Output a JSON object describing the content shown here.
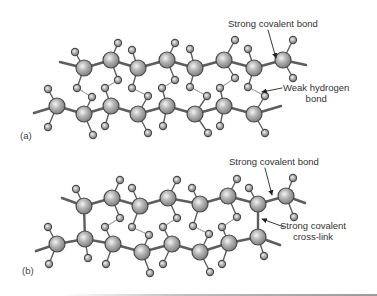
{
  "figure": {
    "panels": [
      {
        "id": "a",
        "label": "(a)",
        "label_pos": [
          20,
          130
        ],
        "annotations": [
          {
            "lines": [
              "Strong covalent bond"
            ],
            "pos": [
              228,
              18
            ],
            "align": "left",
            "arrow": {
              "from": [
                268,
                30
              ],
              "to": [
                276,
                58
              ]
            }
          },
          {
            "lines": [
              "Weak hydrogen",
              "bond"
            ],
            "pos": [
              283,
              82
            ],
            "align": "center",
            "arrow": {
              "from": [
                282,
                88
              ],
              "to": [
                262,
                92
              ]
            }
          }
        ],
        "chains": [
          {
            "line_start": [
              60,
              62
            ],
            "line_end": [
              306,
              65
            ],
            "atoms": [
              [
                84,
                68
              ],
              [
                111,
                60
              ],
              [
                138,
                68
              ],
              [
                167,
                60
              ],
              [
                195,
                68
              ],
              [
                224,
                60
              ],
              [
                254,
                68
              ],
              [
                283,
                60
              ]
            ]
          },
          {
            "line_start": [
              34,
              113
            ],
            "line_end": [
              281,
              106
            ],
            "atoms": [
              [
                57,
                106
              ],
              [
                84,
                114
              ],
              [
                111,
                106
              ],
              [
                138,
                114
              ],
              [
                167,
                106
              ],
              [
                195,
                114
              ],
              [
                224,
                106
              ],
              [
                254,
                114
              ]
            ]
          }
        ],
        "hydrogens": [
          {
            "at": [
              75,
              52
            ],
            "to": [
              84,
              68
            ]
          },
          {
            "at": [
              118,
              43
            ],
            "to": [
              111,
              60
            ]
          },
          {
            "at": [
              132,
              50
            ],
            "to": [
              138,
              68
            ]
          },
          {
            "at": [
              175,
              43
            ],
            "to": [
              167,
              60
            ]
          },
          {
            "at": [
              190,
              49
            ],
            "to": [
              195,
              68
            ]
          },
          {
            "at": [
              235,
              40
            ],
            "to": [
              224,
              60
            ]
          },
          {
            "at": [
              248,
              49
            ],
            "to": [
              254,
              68
            ]
          },
          {
            "at": [
              293,
              40
            ],
            "to": [
              283,
              60
            ]
          },
          {
            "at": [
              77,
              88
            ],
            "to": [
              84,
              68
            ]
          },
          {
            "at": [
              118,
              80
            ],
            "to": [
              111,
              60
            ]
          },
          {
            "at": [
              132,
              88
            ],
            "to": [
              138,
              68
            ]
          },
          {
            "at": [
              175,
              80
            ],
            "to": [
              167,
              60
            ]
          },
          {
            "at": [
              190,
              87
            ],
            "to": [
              195,
              68
            ]
          },
          {
            "at": [
              235,
              78
            ],
            "to": [
              224,
              60
            ]
          },
          {
            "at": [
              248,
              87
            ],
            "to": [
              254,
              68
            ]
          },
          {
            "at": [
              293,
              78
            ],
            "to": [
              283,
              60
            ]
          },
          {
            "at": [
              48,
              89
            ],
            "to": [
              57,
              106
            ]
          },
          {
            "at": [
              92,
              97
            ],
            "to": [
              84,
              114
            ]
          },
          {
            "at": [
              105,
              88
            ],
            "to": [
              111,
              106
            ]
          },
          {
            "at": [
              148,
              96
            ],
            "to": [
              138,
              114
            ]
          },
          {
            "at": [
              162,
              88
            ],
            "to": [
              167,
              106
            ]
          },
          {
            "at": [
              207,
              96
            ],
            "to": [
              195,
              114
            ]
          },
          {
            "at": [
              220,
              88
            ],
            "to": [
              224,
              106
            ]
          },
          {
            "at": [
              265,
              96
            ],
            "to": [
              254,
              114
            ]
          },
          {
            "at": [
              48,
              127
            ],
            "to": [
              57,
              106
            ]
          },
          {
            "at": [
              93,
              135
            ],
            "to": [
              84,
              114
            ]
          },
          {
            "at": [
              105,
              126
            ],
            "to": [
              111,
              106
            ]
          },
          {
            "at": [
              148,
              133
            ],
            "to": [
              138,
              114
            ]
          },
          {
            "at": [
              163,
              126
            ],
            "to": [
              167,
              106
            ]
          },
          {
            "at": [
              208,
              133
            ],
            "to": [
              195,
              114
            ]
          },
          {
            "at": [
              220,
              126
            ],
            "to": [
              224,
              106
            ]
          },
          {
            "at": [
              265,
              133
            ],
            "to": [
              254,
              114
            ]
          }
        ],
        "hydrogen_bonds": [
          [
            [
              77,
              88
            ],
            [
              92,
              97
            ]
          ],
          [
            [
              118,
              80
            ],
            [
              105,
              88
            ]
          ],
          [
            [
              132,
              88
            ],
            [
              148,
              96
            ]
          ],
          [
            [
              175,
              80
            ],
            [
              162,
              88
            ]
          ],
          [
            [
              190,
              87
            ],
            [
              207,
              96
            ]
          ],
          [
            [
              235,
              78
            ],
            [
              220,
              88
            ]
          ],
          [
            [
              248,
              87
            ],
            [
              265,
              96
            ]
          ]
        ],
        "cross_links": []
      },
      {
        "id": "b",
        "label": "(b)",
        "label_pos": [
          22,
          265
        ],
        "annotations": [
          {
            "lines": [
              "Strong covalent bond"
            ],
            "pos": [
              229,
              156
            ],
            "align": "left",
            "arrow": {
              "from": [
                265,
                168
              ],
              "to": [
                272,
                195
              ]
            }
          },
          {
            "lines": [
              "Strong covalent",
              "cross-link"
            ],
            "pos": [
              280,
              220
            ],
            "align": "center",
            "arrow": {
              "from": [
                284,
                227
              ],
              "to": [
                262,
                219
              ]
            }
          }
        ],
        "chains": [
          {
            "line_start": [
              62,
              198
            ],
            "line_end": [
              305,
              203
            ],
            "atoms": [
              [
                84,
                206
              ],
              [
                112,
                198
              ],
              [
                140,
                206
              ],
              [
                168,
                198
              ],
              [
                200,
                204
              ],
              [
                228,
                196
              ],
              [
                258,
                204
              ],
              [
                286,
                196
              ]
            ]
          },
          {
            "line_start": [
              36,
              251
            ],
            "line_end": [
              280,
              245
            ],
            "atoms": [
              [
                57,
                244
              ],
              [
                85,
                239
              ],
              [
                113,
                244
              ],
              [
                142,
                252
              ],
              [
                172,
                244
              ],
              [
                200,
                252
              ],
              [
                229,
                243
              ],
              [
                258,
                237
              ]
            ]
          }
        ],
        "hydrogens": [
          {
            "at": [
              76,
              189
            ],
            "to": [
              84,
              206
            ]
          },
          {
            "at": [
              120,
              180
            ],
            "to": [
              112,
              198
            ]
          },
          {
            "at": [
              132,
              188
            ],
            "to": [
              140,
              206
            ]
          },
          {
            "at": [
              177,
              180
            ],
            "to": [
              168,
              198
            ]
          },
          {
            "at": [
              192,
              188
            ],
            "to": [
              200,
              204
            ]
          },
          {
            "at": [
              237,
              179
            ],
            "to": [
              228,
              196
            ]
          },
          {
            "at": [
              249,
              188
            ],
            "to": [
              258,
              204
            ]
          },
          {
            "at": [
              293,
              178
            ],
            "to": [
              286,
              196
            ]
          },
          {
            "at": [
              120,
              218
            ],
            "to": [
              112,
              198
            ]
          },
          {
            "at": [
              132,
              227
            ],
            "to": [
              140,
              206
            ]
          },
          {
            "at": [
              177,
              218
            ],
            "to": [
              168,
              198
            ]
          },
          {
            "at": [
              193,
              226
            ],
            "to": [
              200,
              204
            ]
          },
          {
            "at": [
              237,
              217
            ],
            "to": [
              228,
              196
            ]
          },
          {
            "at": [
              294,
              217
            ],
            "to": [
              286,
              196
            ]
          },
          {
            "at": [
              48,
              227
            ],
            "to": [
              57,
              244
            ]
          },
          {
            "at": [
              105,
              227
            ],
            "to": [
              113,
              244
            ]
          },
          {
            "at": [
              149,
              235
            ],
            "to": [
              142,
              252
            ]
          },
          {
            "at": [
              163,
              227
            ],
            "to": [
              172,
              244
            ]
          },
          {
            "at": [
              209,
              234
            ],
            "to": [
              200,
              252
            ]
          },
          {
            "at": [
              222,
              227
            ],
            "to": [
              229,
              243
            ]
          },
          {
            "at": [
              49,
              264
            ],
            "to": [
              57,
              244
            ]
          },
          {
            "at": [
              88,
              258
            ],
            "to": [
              85,
              239
            ]
          },
          {
            "at": [
              106,
              264
            ],
            "to": [
              113,
              244
            ]
          },
          {
            "at": [
              150,
              273
            ],
            "to": [
              142,
              252
            ]
          },
          {
            "at": [
              163,
              264
            ],
            "to": [
              172,
              244
            ]
          },
          {
            "at": [
              210,
              272
            ],
            "to": [
              200,
              252
            ]
          },
          {
            "at": [
              222,
              264
            ],
            "to": [
              229,
              243
            ]
          },
          {
            "at": [
              264,
              256
            ],
            "to": [
              258,
              237
            ]
          }
        ],
        "hydrogen_bonds": [
          [
            [
              120,
              218
            ],
            [
              105,
              227
            ]
          ],
          [
            [
              132,
              227
            ],
            [
              149,
              235
            ]
          ],
          [
            [
              177,
              218
            ],
            [
              163,
              227
            ]
          ],
          [
            [
              193,
              226
            ],
            [
              209,
              234
            ]
          ],
          [
            [
              237,
              217
            ],
            [
              222,
              227
            ]
          ]
        ],
        "cross_links": [
          [
            [
              84,
              206
            ],
            [
              85,
              239
            ]
          ],
          [
            [
              258,
              204
            ],
            [
              258,
              237
            ]
          ]
        ]
      }
    ],
    "style": {
      "bond_color": "#5e5e5e",
      "hbond_color": "#9a9a9a",
      "atom_fill_light": "#f2f2f2",
      "atom_fill_mid": "#b0b0b0",
      "atom_fill_dark": "#7c7c7c",
      "atom_stroke": "#4a4a4a",
      "carbon_radius": 8,
      "hydrogen_radius": 3.6,
      "text_color": "#333333"
    }
  }
}
